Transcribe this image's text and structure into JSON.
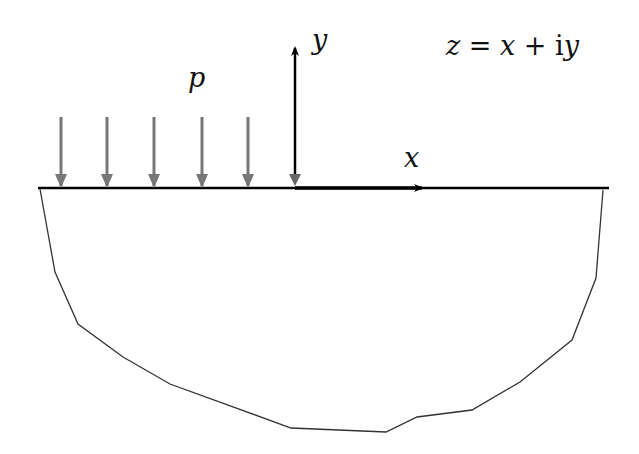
{
  "diagram": {
    "title": "",
    "equation": "z = x + iy",
    "equation_parts": {
      "lhs": "z",
      "eq": " = ",
      "x": "x",
      "plus": " + ",
      "i": "i",
      "y": "y"
    },
    "labels": {
      "y_axis": "y",
      "x_axis": "x",
      "load": "p"
    },
    "colors": {
      "axis": "#000000",
      "load_arrows": "#777777",
      "boundary": "#333333",
      "background": "#ffffff"
    },
    "load_arrow_xs": [
      61,
      107,
      154,
      202,
      248
    ],
    "surface_line": {
      "x1": 38,
      "x2": 609,
      "y": 188
    },
    "origin": {
      "x": 295,
      "y": 188
    },
    "boundary_polygon": [
      [
        40,
        189
      ],
      [
        55,
        272
      ],
      [
        78,
        324
      ],
      [
        123,
        357
      ],
      [
        170,
        384
      ],
      [
        291,
        428
      ],
      [
        386,
        432
      ],
      [
        417,
        417
      ],
      [
        472,
        410
      ],
      [
        520,
        382
      ],
      [
        572,
        340
      ],
      [
        596,
        278
      ],
      [
        603,
        190
      ]
    ]
  }
}
